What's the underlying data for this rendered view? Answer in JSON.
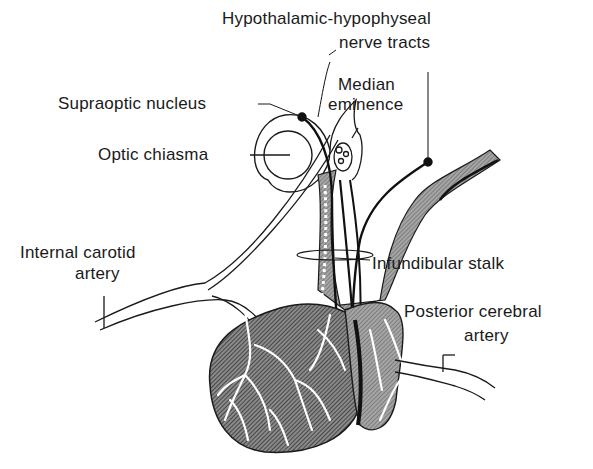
{
  "diagram": {
    "labels": {
      "hypothalamic_hypophyseal_line1": "Hypothalamic-hypophyseal",
      "hypothalamic_hypophyseal_line2": "nerve tracts",
      "supraoptic_nucleus": "Supraoptic nucleus",
      "median_eminence_line1": "Median",
      "median_eminence_line2": "eminence",
      "optic_chiasma": "Optic chiasma",
      "internal_carotid_line1": "Internal carotid",
      "internal_carotid_line2": "artery",
      "infundibular_stalk": "Infundibular stalk",
      "posterior_cerebral_line1": "Posterior cerebral",
      "posterior_cerebral_line2": "artery"
    },
    "colors": {
      "ink": "#1a1a1a",
      "shade": "#6e6e6e",
      "dark_shade": "#3a3a3a",
      "background": "#ffffff"
    }
  }
}
